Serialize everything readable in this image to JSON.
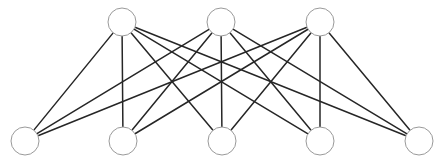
{
  "diagram": {
    "type": "complete-bipartite-graph",
    "canvas": {
      "width": 445,
      "height": 163
    },
    "colors": {
      "background": "#ffffff",
      "edge": "#262626",
      "node_stroke": "#9a9a9a",
      "node_fill": "#ffffff"
    },
    "node_radius": 14,
    "top_layer": [
      {
        "id": "t1",
        "x": 122,
        "y": 22
      },
      {
        "id": "t2",
        "x": 221,
        "y": 22
      },
      {
        "id": "t3",
        "x": 320,
        "y": 22
      }
    ],
    "bottom_layer": [
      {
        "id": "b1",
        "x": 25,
        "y": 141
      },
      {
        "id": "b2",
        "x": 123,
        "y": 141
      },
      {
        "id": "b3",
        "x": 222,
        "y": 141
      },
      {
        "id": "b4",
        "x": 320,
        "y": 141
      },
      {
        "id": "b5",
        "x": 419,
        "y": 141
      }
    ],
    "edges": [
      [
        "t1",
        "b1"
      ],
      [
        "t1",
        "b2"
      ],
      [
        "t1",
        "b3"
      ],
      [
        "t1",
        "b4"
      ],
      [
        "t1",
        "b5"
      ],
      [
        "t2",
        "b1"
      ],
      [
        "t2",
        "b2"
      ],
      [
        "t2",
        "b3"
      ],
      [
        "t2",
        "b4"
      ],
      [
        "t2",
        "b5"
      ],
      [
        "t3",
        "b1"
      ],
      [
        "t3",
        "b2"
      ],
      [
        "t3",
        "b3"
      ],
      [
        "t3",
        "b4"
      ],
      [
        "t3",
        "b5"
      ]
    ]
  }
}
